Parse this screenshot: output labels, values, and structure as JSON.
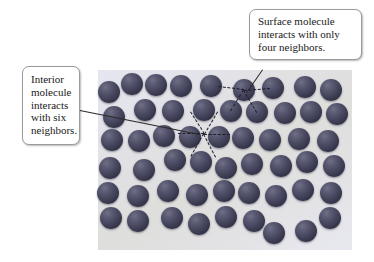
{
  "figure": {
    "type": "molecular-diagram",
    "panel": {
      "background_color": "#e3e3ef",
      "x": 98,
      "y": 70,
      "width": 254,
      "height": 180
    },
    "molecule_color": "#46465e",
    "bond_color": "#1d1d2c"
  },
  "callouts": {
    "surface": {
      "text": "Surface molecule interacts with only four neighbors.",
      "neighbor_count": 4
    },
    "interior": {
      "text": "Interior molecule interacts with six neighbors.",
      "neighbor_count": 6
    }
  },
  "molecules": [
    {
      "x": 109,
      "y": 92,
      "r": 11
    },
    {
      "x": 132,
      "y": 84,
      "r": 11
    },
    {
      "x": 156,
      "y": 85,
      "r": 11
    },
    {
      "x": 181,
      "y": 86,
      "r": 11
    },
    {
      "x": 211,
      "y": 86,
      "r": 11
    },
    {
      "x": 244,
      "y": 90,
      "r": 11
    },
    {
      "x": 273,
      "y": 88,
      "r": 11
    },
    {
      "x": 305,
      "y": 87,
      "r": 11
    },
    {
      "x": 331,
      "y": 90,
      "r": 11
    },
    {
      "x": 114,
      "y": 117,
      "r": 11
    },
    {
      "x": 145,
      "y": 110,
      "r": 11
    },
    {
      "x": 173,
      "y": 111,
      "r": 11
    },
    {
      "x": 204,
      "y": 110,
      "r": 11
    },
    {
      "x": 231,
      "y": 111,
      "r": 11
    },
    {
      "x": 257,
      "y": 112,
      "r": 11
    },
    {
      "x": 285,
      "y": 113,
      "r": 11
    },
    {
      "x": 311,
      "y": 112,
      "r": 11
    },
    {
      "x": 337,
      "y": 114,
      "r": 11
    },
    {
      "x": 112,
      "y": 140,
      "r": 11
    },
    {
      "x": 139,
      "y": 141,
      "r": 11
    },
    {
      "x": 164,
      "y": 136,
      "r": 11
    },
    {
      "x": 190,
      "y": 137,
      "r": 11
    },
    {
      "x": 219,
      "y": 137,
      "r": 11
    },
    {
      "x": 243,
      "y": 138,
      "r": 11
    },
    {
      "x": 270,
      "y": 140,
      "r": 11
    },
    {
      "x": 299,
      "y": 139,
      "r": 11
    },
    {
      "x": 328,
      "y": 141,
      "r": 11
    },
    {
      "x": 110,
      "y": 168,
      "r": 11
    },
    {
      "x": 144,
      "y": 170,
      "r": 11
    },
    {
      "x": 175,
      "y": 160,
      "r": 11
    },
    {
      "x": 201,
      "y": 162,
      "r": 11
    },
    {
      "x": 226,
      "y": 168,
      "r": 11
    },
    {
      "x": 252,
      "y": 164,
      "r": 11
    },
    {
      "x": 281,
      "y": 166,
      "r": 11
    },
    {
      "x": 307,
      "y": 162,
      "r": 11
    },
    {
      "x": 334,
      "y": 166,
      "r": 11
    },
    {
      "x": 108,
      "y": 193,
      "r": 11
    },
    {
      "x": 138,
      "y": 196,
      "r": 11
    },
    {
      "x": 168,
      "y": 191,
      "r": 11
    },
    {
      "x": 197,
      "y": 195,
      "r": 11
    },
    {
      "x": 224,
      "y": 191,
      "r": 11
    },
    {
      "x": 249,
      "y": 193,
      "r": 11
    },
    {
      "x": 276,
      "y": 196,
      "r": 11
    },
    {
      "x": 303,
      "y": 190,
      "r": 11
    },
    {
      "x": 331,
      "y": 193,
      "r": 11
    },
    {
      "x": 111,
      "y": 218,
      "r": 11
    },
    {
      "x": 138,
      "y": 221,
      "r": 11
    },
    {
      "x": 172,
      "y": 218,
      "r": 11
    },
    {
      "x": 199,
      "y": 224,
      "r": 11
    },
    {
      "x": 226,
      "y": 217,
      "r": 11
    },
    {
      "x": 254,
      "y": 221,
      "r": 11
    },
    {
      "x": 274,
      "y": 233,
      "r": 11
    },
    {
      "x": 306,
      "y": 231,
      "r": 11
    },
    {
      "x": 330,
      "y": 218,
      "r": 11
    }
  ],
  "bonds": {
    "surface": [
      {
        "x1": 244,
        "y1": 90,
        "x2": 218,
        "y2": 87
      },
      {
        "x1": 244,
        "y1": 90,
        "x2": 270,
        "y2": 88
      },
      {
        "x1": 244,
        "y1": 90,
        "x2": 231,
        "y2": 111
      },
      {
        "x1": 244,
        "y1": 90,
        "x2": 257,
        "y2": 112
      }
    ],
    "interior": [
      {
        "x1": 204,
        "y1": 134,
        "x2": 178,
        "y2": 134
      },
      {
        "x1": 204,
        "y1": 134,
        "x2": 230,
        "y2": 134
      },
      {
        "x1": 204,
        "y1": 134,
        "x2": 190,
        "y2": 112
      },
      {
        "x1": 204,
        "y1": 134,
        "x2": 217,
        "y2": 112
      },
      {
        "x1": 204,
        "y1": 134,
        "x2": 191,
        "y2": 157
      },
      {
        "x1": 204,
        "y1": 134,
        "x2": 216,
        "y2": 157
      }
    ]
  },
  "leaders": [
    {
      "name": "surface",
      "x1": 263,
      "y1": 70,
      "x2": 247,
      "y2": 93
    },
    {
      "name": "interior",
      "x1": 80,
      "y1": 110,
      "x2": 200,
      "y2": 134
    }
  ]
}
